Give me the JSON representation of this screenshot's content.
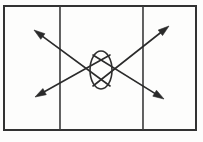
{
  "figure": {
    "kind": "line-diagram",
    "title": "",
    "background_color": "#fdfdfc",
    "ink_color": "#2b2b2b",
    "caption_partial": "",
    "border": {
      "name": "outer-rectangle",
      "x": 4,
      "y": 6,
      "width": 192,
      "height": 124,
      "stroke_width": 2.0,
      "color": "#333333"
    },
    "dividers": [
      {
        "name": "left-vertical-divider",
        "x": 60,
        "y1": 6,
        "y2": 130,
        "stroke_width": 1.6,
        "color": "#3a3a3a"
      },
      {
        "name": "right-vertical-divider",
        "x": 143,
        "y1": 6,
        "y2": 130,
        "stroke_width": 1.6,
        "color": "#3a3a3a"
      }
    ],
    "ellipse": {
      "name": "center-ellipse",
      "cx": 101,
      "cy": 70,
      "rx": 11,
      "ry": 19,
      "stroke_width": 1.6,
      "color": "#2f2f2f",
      "fill": "none"
    },
    "arrows": [
      {
        "name": "arrow-upper-left",
        "direction": "up-left",
        "from_x": 110,
        "from_y": 86,
        "to_x": 34,
        "to_y": 30,
        "stroke_width": 1.6,
        "head_length": 11,
        "head_width": 7,
        "color": "#2b2b2b"
      },
      {
        "name": "arrow-upper-right",
        "direction": "up-right",
        "from_x": 93,
        "from_y": 86,
        "to_x": 169,
        "to_y": 26,
        "stroke_width": 1.6,
        "head_length": 11,
        "head_width": 7,
        "color": "#2b2b2b"
      },
      {
        "name": "arrow-lower-left",
        "direction": "down-left",
        "from_x": 110,
        "from_y": 55,
        "to_x": 35,
        "to_y": 97,
        "stroke_width": 1.6,
        "head_length": 11,
        "head_width": 7,
        "color": "#2b2b2b"
      },
      {
        "name": "arrow-lower-right",
        "direction": "down-right",
        "from_x": 93,
        "from_y": 55,
        "to_x": 164,
        "to_y": 99,
        "stroke_width": 1.6,
        "head_length": 11,
        "head_width": 7,
        "color": "#2b2b2b"
      }
    ]
  }
}
